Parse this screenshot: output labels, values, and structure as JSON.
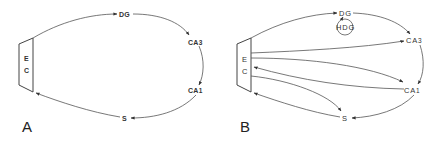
{
  "figure": {
    "panels": [
      {
        "label": "A",
        "nodes": {
          "ec_top": "E",
          "ec_bottom": "C",
          "dg": "DG",
          "ca3": "CA3",
          "ca1": "CA1",
          "s": "S"
        },
        "connections": [
          {
            "from": "EC",
            "to": "DG"
          },
          {
            "from": "DG",
            "to": "CA3"
          },
          {
            "from": "CA3",
            "to": "CA1"
          },
          {
            "from": "CA1",
            "to": "S"
          },
          {
            "from": "S",
            "to": "EC"
          }
        ]
      },
      {
        "label": "B",
        "nodes": {
          "ec_top": "E",
          "ec_bottom": "C",
          "dg": "DG",
          "hdg": "HDG",
          "ca3": "CA3",
          "ca1": "CA1",
          "s": "S"
        },
        "connections": [
          {
            "from": "EC",
            "to": "DG"
          },
          {
            "from": "DG",
            "to": "CA3"
          },
          {
            "from": "HDG",
            "to": "DG",
            "note": "circular loop"
          },
          {
            "from": "EC",
            "to": "CA3"
          },
          {
            "from": "EC",
            "to": "CA1"
          },
          {
            "from": "CA3",
            "to": "CA1"
          },
          {
            "from": "CA1",
            "to": "EC"
          },
          {
            "from": "CA1",
            "to": "S"
          },
          {
            "from": "EC",
            "to": "S"
          },
          {
            "from": "S",
            "to": "EC"
          }
        ]
      }
    ],
    "colors": {
      "line": "#555555",
      "text": "#333333",
      "background": "#ffffff"
    }
  }
}
